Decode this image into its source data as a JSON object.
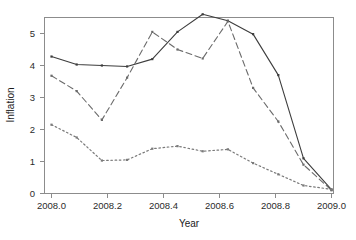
{
  "chart_data": {
    "type": "line",
    "title": "",
    "xlabel": "Year",
    "ylabel": "Inflation",
    "xlim": [
      2007.95,
      2009.02
    ],
    "ylim": [
      -0.15,
      5.85
    ],
    "xticks": [
      2008.0,
      2008.2,
      2008.4,
      2008.6,
      2008.8,
      2009.0
    ],
    "xticklabels": [
      "2008.0",
      "2008.2",
      "2008.4",
      "2008.6",
      "2008.8",
      "2009.0"
    ],
    "yticks": [
      0,
      1,
      2,
      3,
      4,
      5
    ],
    "yticklabels": [
      "0",
      "1",
      "2",
      "3",
      "4",
      "5"
    ],
    "grid": false,
    "legend": "none",
    "x": [
      2008.0,
      2008.09,
      2008.18,
      2008.27,
      2008.36,
      2008.45,
      2008.54,
      2008.63,
      2008.72,
      2008.81,
      2008.9,
      2009.0
    ],
    "series": [
      {
        "name": "series-solid",
        "style": "solid",
        "color": "#3d3d3d",
        "marker": "square",
        "values": [
          4.28,
          4.03,
          4.0,
          3.97,
          4.2,
          5.05,
          5.6,
          5.4,
          4.98,
          3.7,
          1.1,
          0.12
        ]
      },
      {
        "name": "series-dashed",
        "style": "dashed",
        "color": "#6b6b6b",
        "marker": "square",
        "values": [
          3.68,
          3.2,
          2.3,
          3.62,
          5.05,
          4.5,
          4.22,
          5.38,
          3.3,
          2.25,
          0.9,
          0.1
        ]
      },
      {
        "name": "series-dotted",
        "style": "dotted",
        "color": "#7a7a7a",
        "marker": "square",
        "values": [
          2.15,
          1.75,
          1.03,
          1.05,
          1.4,
          1.48,
          1.32,
          1.38,
          0.95,
          0.6,
          0.25,
          0.13
        ]
      }
    ]
  },
  "axes": {
    "ylabel": "Inflation",
    "xlabel": "Year",
    "xticklabels": [
      "2008.0",
      "2008.2",
      "2008.4",
      "2008.6",
      "2008.8",
      "2009.0"
    ],
    "yticklabels": [
      "0",
      "1",
      "2",
      "3",
      "4",
      "5"
    ]
  },
  "colors": {
    "background": "#ffffff",
    "frame": "#8c8c8c",
    "text": "#1a1a1a",
    "solid": "#3d3d3d",
    "dashed": "#6b6b6b",
    "dotted": "#7a7a7a"
  }
}
